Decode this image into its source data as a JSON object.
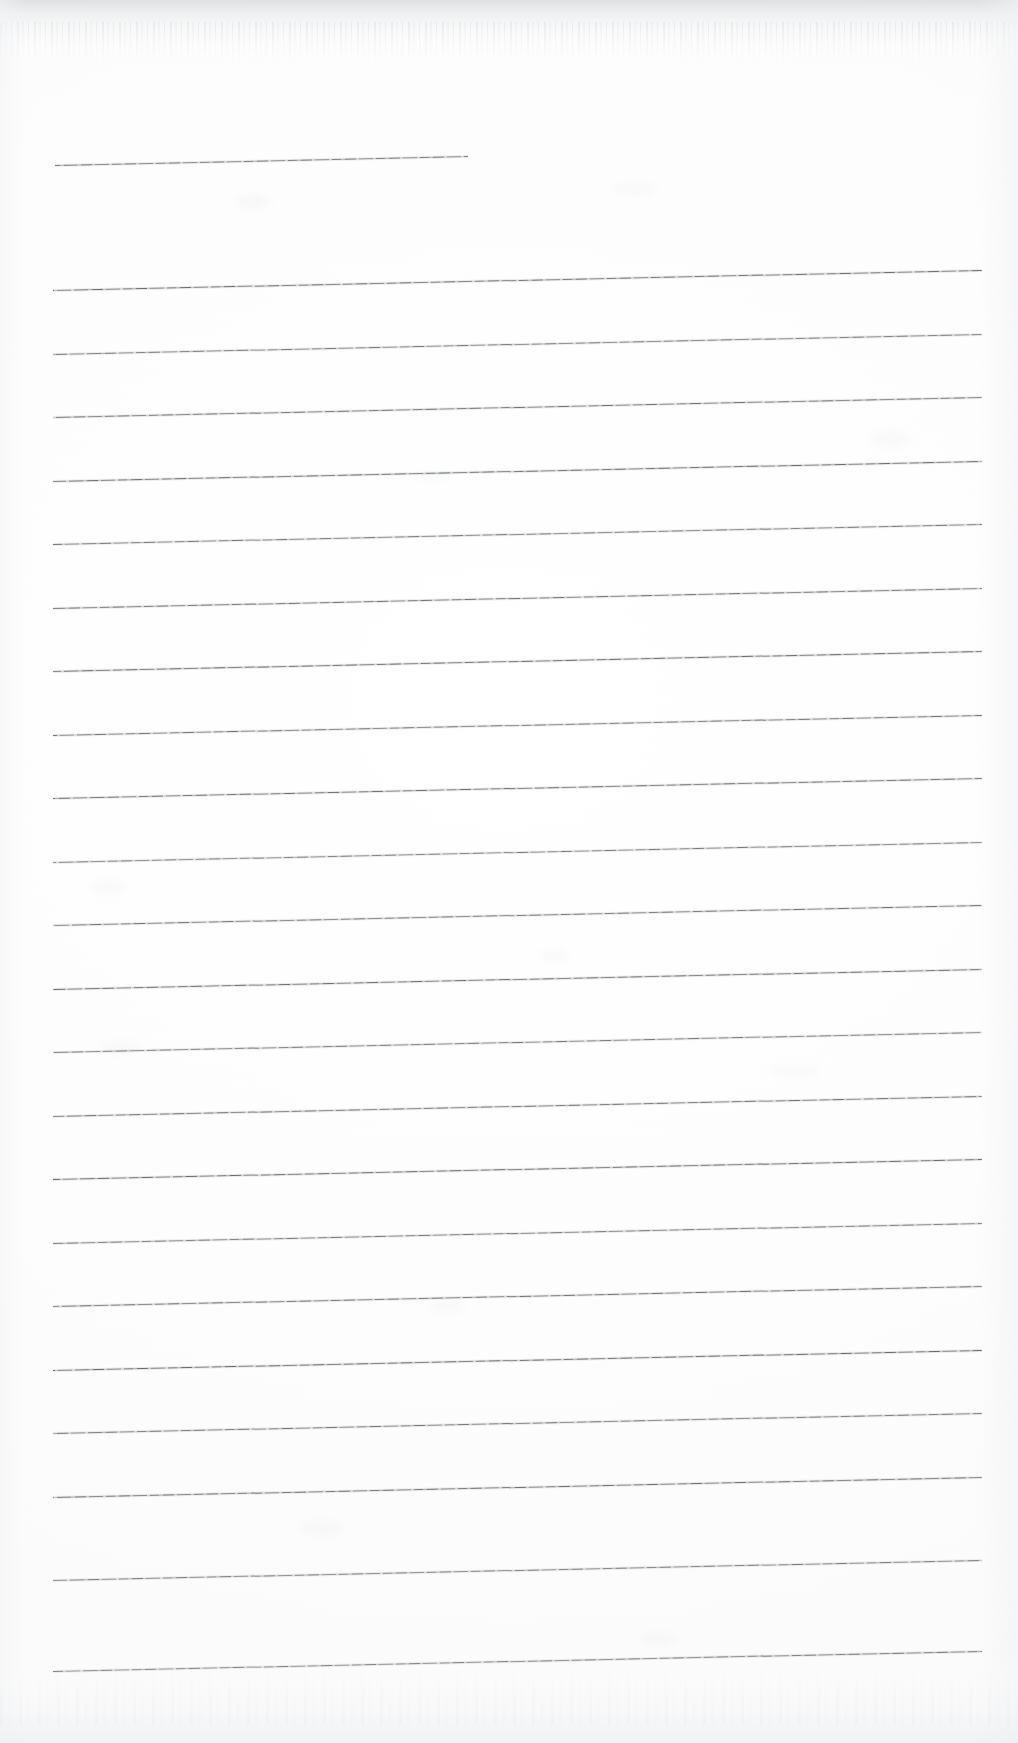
{
  "document": {
    "kind": "scanned-ruled-paper",
    "title": "Blank Lined Notebook Page",
    "width": 1018,
    "height": 1743,
    "background_color": "#fdfdfd",
    "rule_color": "#56585c",
    "written_content": "",
    "notes": "Scan of an empty ruled sheet; no text, headings, numbers or marks are present."
  },
  "page_edges": {
    "top_shadow_color": "#cdcfd2",
    "bottom_shadow_color": "#eaecee",
    "side_vignette_color": "#f2f3f5"
  },
  "ruling": {
    "line_count": 23,
    "left_x": 53,
    "right_x": 982,
    "spacing": 63.5,
    "tilt_degrees": -1.24,
    "first_line_is_short": true,
    "lines": [
      {
        "index": 1,
        "left_x": 55,
        "right_x": 468,
        "left_y": 165,
        "short": true
      },
      {
        "index": 2,
        "left_x": 53,
        "right_x": 982,
        "left_y": 290,
        "short": false
      },
      {
        "index": 3,
        "left_x": 53,
        "right_x": 982,
        "left_y": 354,
        "short": false
      },
      {
        "index": 4,
        "left_x": 53,
        "right_x": 982,
        "left_y": 417,
        "short": false
      },
      {
        "index": 5,
        "left_x": 53,
        "right_x": 982,
        "left_y": 481,
        "short": false
      },
      {
        "index": 6,
        "left_x": 53,
        "right_x": 982,
        "left_y": 544,
        "short": false
      },
      {
        "index": 7,
        "left_x": 53,
        "right_x": 982,
        "left_y": 608,
        "short": false
      },
      {
        "index": 8,
        "left_x": 53,
        "right_x": 982,
        "left_y": 671,
        "short": false
      },
      {
        "index": 9,
        "left_x": 53,
        "right_x": 982,
        "left_y": 735,
        "short": false
      },
      {
        "index": 10,
        "left_x": 53,
        "right_x": 982,
        "left_y": 798,
        "short": false
      },
      {
        "index": 11,
        "left_x": 53,
        "right_x": 982,
        "left_y": 862,
        "short": false
      },
      {
        "index": 12,
        "left_x": 53,
        "right_x": 982,
        "left_y": 925,
        "short": false
      },
      {
        "index": 13,
        "left_x": 53,
        "right_x": 982,
        "left_y": 989,
        "short": false
      },
      {
        "index": 14,
        "left_x": 53,
        "right_x": 982,
        "left_y": 1052,
        "short": false
      },
      {
        "index": 15,
        "left_x": 53,
        "right_x": 982,
        "left_y": 1116,
        "short": false
      },
      {
        "index": 16,
        "left_x": 53,
        "right_x": 982,
        "left_y": 1179,
        "short": false
      },
      {
        "index": 17,
        "left_x": 53,
        "right_x": 982,
        "left_y": 1243,
        "short": false
      },
      {
        "index": 18,
        "left_x": 53,
        "right_x": 982,
        "left_y": 1306,
        "short": false
      },
      {
        "index": 19,
        "left_x": 53,
        "right_x": 982,
        "left_y": 1370,
        "short": false
      },
      {
        "index": 20,
        "left_x": 53,
        "right_x": 982,
        "left_y": 1433,
        "short": false
      },
      {
        "index": 21,
        "left_x": 53,
        "right_x": 982,
        "left_y": 1497,
        "short": false
      },
      {
        "index": 22,
        "left_x": 53,
        "right_x": 982,
        "left_y": 1580,
        "short": false
      },
      {
        "index": 23,
        "left_x": 53,
        "right_x": 982,
        "left_y": 1671,
        "short": false
      }
    ]
  },
  "blemishes": [
    {
      "x": 236,
      "y": 194,
      "w": 34,
      "h": 16,
      "opacity": 0.05
    },
    {
      "x": 612,
      "y": 182,
      "w": 46,
      "h": 14,
      "opacity": 0.04
    },
    {
      "x": 418,
      "y": 470,
      "w": 30,
      "h": 12,
      "opacity": 0.045
    },
    {
      "x": 870,
      "y": 430,
      "w": 40,
      "h": 18,
      "opacity": 0.04
    },
    {
      "x": 90,
      "y": 880,
      "w": 36,
      "h": 14,
      "opacity": 0.04
    },
    {
      "x": 540,
      "y": 950,
      "w": 28,
      "h": 11,
      "opacity": 0.05
    },
    {
      "x": 100,
      "y": 1040,
      "w": 42,
      "h": 15,
      "opacity": 0.04
    },
    {
      "x": 770,
      "y": 1065,
      "w": 50,
      "h": 12,
      "opacity": 0.045
    },
    {
      "x": 430,
      "y": 1300,
      "w": 34,
      "h": 13,
      "opacity": 0.04
    },
    {
      "x": 300,
      "y": 1520,
      "w": 44,
      "h": 16,
      "opacity": 0.04
    },
    {
      "x": 640,
      "y": 1632,
      "w": 38,
      "h": 14,
      "opacity": 0.04
    }
  ]
}
